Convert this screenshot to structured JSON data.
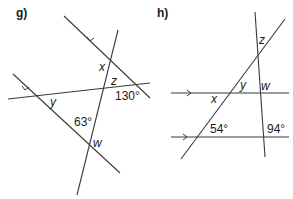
{
  "diagrams": [
    {
      "id": "g",
      "label": "g)",
      "labels": {
        "x": "x",
        "z": "z",
        "y": "y",
        "w": "w",
        "angle_130": "130°",
        "angle_63": "63°"
      },
      "description": "Two parallel lines (marked with arrows) crossed by a horizontal line and a steep transversal"
    },
    {
      "id": "h",
      "label": "h)",
      "labels": {
        "z": "z",
        "y": "y",
        "w": "w",
        "x": "x",
        "angle_54": "54°",
        "angle_94": "94°"
      },
      "description": "Two horizontal parallel lines (marked with arrows) crossed by two transversals"
    }
  ]
}
